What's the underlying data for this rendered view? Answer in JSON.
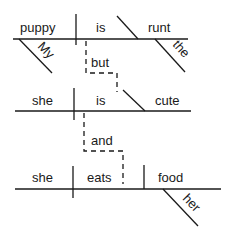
{
  "diagram": {
    "type": "Reed-Kellogg sentence diagram",
    "clauses": [
      {
        "subject": "puppy",
        "verb": "is",
        "complement": "runt",
        "modifiers": {
          "subject": "My",
          "complement": "the"
        }
      },
      {
        "subject": "she",
        "verb": "is",
        "complement": "cute"
      },
      {
        "subject": "she",
        "verb": "eats",
        "object": "food",
        "modifiers": {
          "object": "her"
        }
      }
    ],
    "conjunctions": [
      "but",
      "and"
    ]
  }
}
